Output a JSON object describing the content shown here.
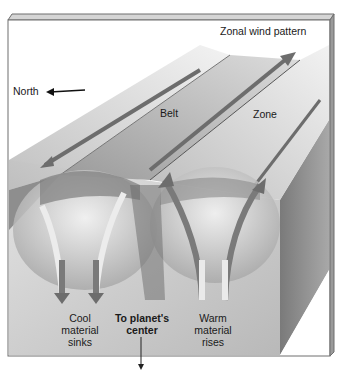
{
  "figure": {
    "labels": {
      "north": "North",
      "zonal_wind": "Zonal wind pattern",
      "belt": "Belt",
      "zone": "Zone",
      "cool_line1": "Cool",
      "cool_line2": "material",
      "cool_line3": "sinks",
      "center_line1": "To planet's",
      "center_line2": "center",
      "warm_line1": "Warm",
      "warm_line2": "material",
      "warm_line3": "rises"
    },
    "colors": {
      "frame": "#6f6f6f",
      "arrow": "#7a7a7a",
      "light_arrow": "#e6e6e6",
      "background_front": "#c8c8c8",
      "side_face": "#8c8c8c"
    }
  }
}
